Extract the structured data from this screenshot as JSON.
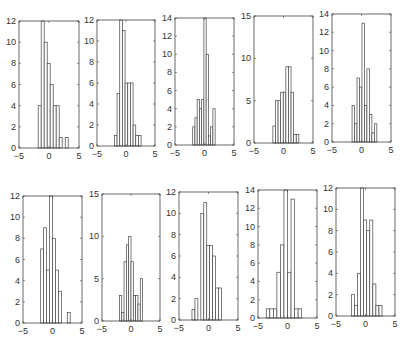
{
  "figure": {
    "title": "",
    "layout": {
      "rows": 2,
      "cols": 5
    }
  },
  "chart_data": [
    {
      "type": "bar",
      "subplot": "r1c1",
      "title": "",
      "xlabel": "",
      "ylabel": "",
      "xlim": [
        -5,
        5
      ],
      "ylim": [
        0,
        12
      ],
      "xticks": [
        "-5",
        "0",
        "5"
      ],
      "yticks": [
        "0",
        "2",
        "4",
        "6",
        "8",
        "10",
        "12"
      ],
      "bin_range": [
        -1.8,
        3.2
      ],
      "values": [
        4,
        12,
        10,
        8,
        6,
        4,
        4,
        1,
        0,
        1
      ],
      "overflow_bar": 1
    },
    {
      "type": "bar",
      "subplot": "r1c2",
      "title": "",
      "xlabel": "",
      "ylabel": "",
      "xlim": [
        -5,
        5
      ],
      "ylim": [
        0,
        12
      ],
      "xticks": [
        "-5",
        "0",
        "5"
      ],
      "yticks": [
        "0",
        "2",
        "4",
        "6",
        "8",
        "10",
        "12"
      ],
      "bin_range": [
        -2.0,
        2.6
      ],
      "values": [
        1,
        5,
        12,
        11,
        6,
        6,
        6,
        2,
        1,
        1
      ],
      "overflow_bar": 2
    },
    {
      "type": "bar",
      "subplot": "r1c3",
      "title": "",
      "xlabel": "",
      "ylabel": "",
      "xlim": [
        -5,
        5
      ],
      "ylim": [
        0,
        14
      ],
      "xticks": [
        "-5",
        "0",
        "5"
      ],
      "yticks": [
        "0",
        "2",
        "4",
        "6",
        "8",
        "10",
        "12",
        "14"
      ],
      "bin_range": [
        -2.0,
        1.8
      ],
      "values": [
        2,
        3,
        5,
        4,
        5,
        14,
        10,
        1,
        2,
        4
      ],
      "overflow_bar": 5
    },
    {
      "type": "bar",
      "subplot": "r1c4",
      "title": "",
      "xlabel": "",
      "ylabel": "",
      "xlim": [
        -5,
        5
      ],
      "ylim": [
        0,
        15
      ],
      "xticks": [
        "-5",
        "0",
        "5"
      ],
      "yticks": [
        "0",
        "5",
        "10",
        "15"
      ],
      "bin_range": [
        -1.8,
        2.6
      ],
      "values": [
        2,
        5,
        5,
        6,
        6,
        9,
        9,
        6,
        1,
        1
      ]
    },
    {
      "type": "bar",
      "subplot": "r1c5",
      "title": "",
      "xlabel": "",
      "ylabel": "",
      "xlim": [
        -5,
        5
      ],
      "ylim": [
        0,
        14
      ],
      "xticks": [
        "-5",
        "0",
        "5"
      ],
      "yticks": [
        "0",
        "2",
        "4",
        "6",
        "8",
        "10",
        "12",
        "14"
      ],
      "bin_range": [
        -1.6,
        2.6
      ],
      "values": [
        4,
        2,
        7,
        6,
        13,
        4,
        8,
        3,
        1,
        2
      ]
    },
    {
      "type": "bar",
      "subplot": "r2c1",
      "title": "",
      "xlabel": "",
      "ylabel": "",
      "xlim": [
        -5,
        5
      ],
      "ylim": [
        0,
        12
      ],
      "xticks": [
        "-5",
        "0",
        "5"
      ],
      "yticks": [
        "0",
        "2",
        "4",
        "6",
        "8",
        "10",
        "12"
      ],
      "bin_range": [
        -2.0,
        3.0
      ],
      "values": [
        7,
        9,
        5,
        12,
        8,
        5,
        3,
        0,
        0,
        1
      ],
      "overflow_bar": 3
    },
    {
      "type": "bar",
      "subplot": "r2c2",
      "title": "",
      "xlabel": "",
      "ylabel": "",
      "xlim": [
        -5,
        5
      ],
      "ylim": [
        0,
        15
      ],
      "xticks": [
        "-5",
        "0",
        "5"
      ],
      "yticks": [
        "0",
        "5",
        "10",
        "15"
      ],
      "bin_range": [
        -2.0,
        2.0
      ],
      "values": [
        3,
        1,
        7,
        9,
        10,
        7,
        3,
        3,
        2,
        5
      ]
    },
    {
      "type": "bar",
      "subplot": "r2c3",
      "title": "",
      "xlabel": "",
      "ylabel": "",
      "xlim": [
        -5,
        5
      ],
      "ylim": [
        0,
        12
      ],
      "xticks": [
        "-5",
        "0",
        "5"
      ],
      "yticks": [
        "0",
        "2",
        "4",
        "6",
        "8",
        "10",
        "12"
      ],
      "bin_range": [
        -2.8,
        2.2
      ],
      "values": [
        1,
        2,
        0,
        10,
        11,
        7,
        7,
        6,
        3,
        3
      ]
    },
    {
      "type": "bar",
      "subplot": "r2c4",
      "title": "",
      "xlabel": "",
      "ylabel": "",
      "xlim": [
        -5,
        5
      ],
      "ylim": [
        0,
        14
      ],
      "xticks": [
        "-5",
        "0",
        "5"
      ],
      "yticks": [
        "0",
        "2",
        "4",
        "6",
        "8",
        "10",
        "12",
        "14"
      ],
      "bin_range": [
        -3.6,
        2.4
      ],
      "values": [
        1,
        1,
        1,
        5,
        8,
        14,
        5,
        13,
        1,
        1
      ],
      "overflow_bar": 5
    },
    {
      "type": "bar",
      "subplot": "r2c5",
      "title": "",
      "xlabel": "",
      "ylabel": "",
      "xlim": [
        -5,
        5
      ],
      "ylim": [
        0,
        12
      ],
      "xticks": [
        "-5",
        "0",
        "5"
      ],
      "yticks": [
        "0",
        "2",
        "4",
        "6",
        "8",
        "10",
        "12"
      ],
      "bin_range": [
        -2.4,
        2.8
      ],
      "values": [
        2,
        1,
        4,
        12,
        9,
        8,
        9,
        3,
        1,
        1
      ],
      "overflow_bar": 3
    }
  ],
  "layout_px": [
    {
      "x0": 19,
      "x1": 79,
      "y0": 21,
      "y1": 148
    },
    {
      "x0": 97,
      "x1": 155,
      "y0": 20,
      "y1": 146
    },
    {
      "x0": 175,
      "x1": 234,
      "y0": 18,
      "y1": 145
    },
    {
      "x0": 254,
      "x1": 313,
      "y0": 16,
      "y1": 143
    },
    {
      "x0": 332,
      "x1": 391,
      "y0": 14,
      "y1": 142
    },
    {
      "x0": 23,
      "x1": 82,
      "y0": 196,
      "y1": 323
    },
    {
      "x0": 102,
      "x1": 160,
      "y0": 194,
      "y1": 321
    },
    {
      "x0": 179,
      "x1": 238,
      "y0": 192,
      "y1": 320
    },
    {
      "x0": 258,
      "x1": 317,
      "y0": 190,
      "y1": 318
    },
    {
      "x0": 336,
      "x1": 395,
      "y0": 188,
      "y1": 316
    }
  ]
}
